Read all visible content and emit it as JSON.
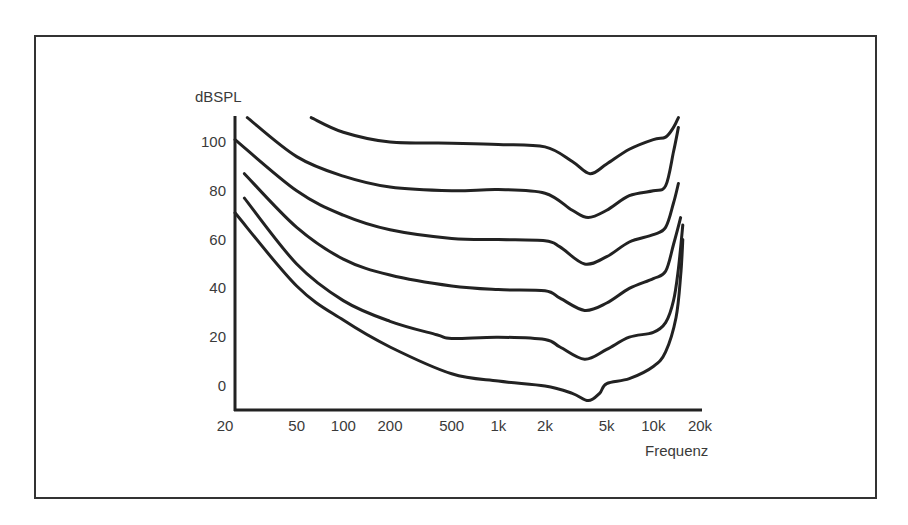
{
  "chart_data": {
    "type": "line",
    "title": "",
    "xlabel": "Frequenz",
    "ylabel": "dBSPL",
    "x_scale": "log",
    "xlim": [
      20,
      20000
    ],
    "ylim": [
      -10,
      110
    ],
    "grid": false,
    "legend": null,
    "x_ticks": [
      {
        "value": 20,
        "label": "20"
      },
      {
        "value": 50,
        "label": "50"
      },
      {
        "value": 100,
        "label": "100"
      },
      {
        "value": 200,
        "label": "200"
      },
      {
        "value": 500,
        "label": "500"
      },
      {
        "value": 1000,
        "label": "1k"
      },
      {
        "value": 2000,
        "label": "2k"
      },
      {
        "value": 5000,
        "label": "5k"
      },
      {
        "value": 10000,
        "label": "10k"
      },
      {
        "value": 20000,
        "label": "20k"
      }
    ],
    "y_ticks": [
      {
        "value": 100,
        "label": "100"
      },
      {
        "value": 80,
        "label": "80"
      },
      {
        "value": 60,
        "label": "60"
      },
      {
        "value": 40,
        "label": "40"
      },
      {
        "value": 20,
        "label": "20"
      },
      {
        "value": 0,
        "label": "0"
      }
    ],
    "series": [
      {
        "name": "curve-100",
        "points": [
          [
            62,
            110
          ],
          [
            100,
            104
          ],
          [
            200,
            100
          ],
          [
            500,
            99.5
          ],
          [
            1000,
            99
          ],
          [
            2000,
            98
          ],
          [
            3000,
            92
          ],
          [
            3900,
            87
          ],
          [
            5000,
            91
          ],
          [
            7000,
            97
          ],
          [
            10000,
            101
          ],
          [
            12000,
            102
          ],
          [
            13500,
            106
          ],
          [
            14500,
            110
          ]
        ]
      },
      {
        "name": "curve-80",
        "points": [
          [
            24,
            110
          ],
          [
            50,
            94
          ],
          [
            100,
            86
          ],
          [
            200,
            81.5
          ],
          [
            500,
            80
          ],
          [
            1000,
            80.5
          ],
          [
            2000,
            79
          ],
          [
            3000,
            72
          ],
          [
            3800,
            69
          ],
          [
            5000,
            72
          ],
          [
            7000,
            78
          ],
          [
            10000,
            80
          ],
          [
            12000,
            82
          ],
          [
            13500,
            96
          ],
          [
            14500,
            106
          ]
        ]
      },
      {
        "name": "curve-60",
        "points": [
          [
            20,
            101
          ],
          [
            50,
            80
          ],
          [
            100,
            70
          ],
          [
            200,
            64
          ],
          [
            500,
            60.5
          ],
          [
            1000,
            60
          ],
          [
            2000,
            59.5
          ],
          [
            2500,
            57
          ],
          [
            3600,
            50
          ],
          [
            5000,
            53
          ],
          [
            7000,
            59
          ],
          [
            10000,
            62
          ],
          [
            12000,
            65
          ],
          [
            13500,
            75
          ],
          [
            14500,
            83
          ]
        ]
      },
      {
        "name": "curve-40",
        "points": [
          [
            23,
            87
          ],
          [
            50,
            65
          ],
          [
            100,
            52
          ],
          [
            200,
            45.5
          ],
          [
            500,
            41
          ],
          [
            1000,
            39.5
          ],
          [
            2000,
            39
          ],
          [
            2500,
            36
          ],
          [
            3600,
            31
          ],
          [
            5000,
            34
          ],
          [
            7000,
            40
          ],
          [
            10000,
            44
          ],
          [
            12000,
            47
          ],
          [
            13500,
            58
          ],
          [
            15000,
            69
          ]
        ]
      },
      {
        "name": "curve-20",
        "points": [
          [
            23,
            77
          ],
          [
            50,
            50
          ],
          [
            100,
            35
          ],
          [
            200,
            26.5
          ],
          [
            400,
            21
          ],
          [
            500,
            19.5
          ],
          [
            1000,
            20
          ],
          [
            2000,
            19
          ],
          [
            2500,
            16
          ],
          [
            3600,
            11
          ],
          [
            5000,
            15
          ],
          [
            7000,
            20
          ],
          [
            10000,
            22
          ],
          [
            12000,
            26
          ],
          [
            13500,
            35
          ],
          [
            14500,
            48
          ],
          [
            15500,
            66
          ]
        ]
      },
      {
        "name": "curve-0",
        "points": [
          [
            20,
            71
          ],
          [
            50,
            41
          ],
          [
            100,
            27
          ],
          [
            200,
            16
          ],
          [
            500,
            5
          ],
          [
            1000,
            2
          ],
          [
            2000,
            0
          ],
          [
            3000,
            -3
          ],
          [
            3800,
            -6
          ],
          [
            4500,
            -3
          ],
          [
            5000,
            1
          ],
          [
            7000,
            3
          ],
          [
            10000,
            8
          ],
          [
            12000,
            14
          ],
          [
            14000,
            28
          ],
          [
            15000,
            45
          ],
          [
            15500,
            60
          ]
        ]
      }
    ]
  }
}
